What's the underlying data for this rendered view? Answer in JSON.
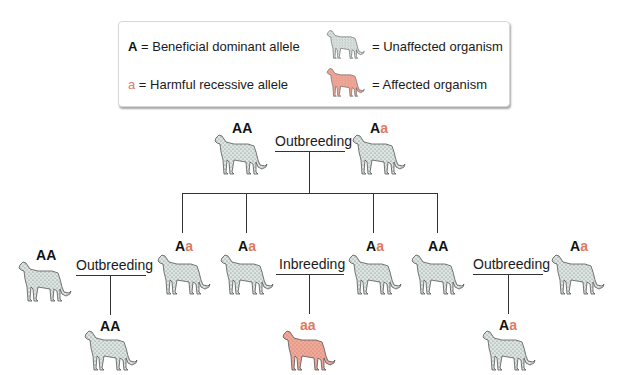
{
  "legend": {
    "dominant_symbol": "A",
    "dominant_text": " = Beneficial dominant allele",
    "recessive_symbol": "a",
    "recessive_text": " = Harmful recessive allele",
    "unaffected_text": "= Unaffected organism",
    "affected_text": "= Affected organism"
  },
  "colors": {
    "recessive": "#e07a5f",
    "unaffected_fill": "#dde5e3",
    "affected_fill": "#f0a898",
    "line": "#333333"
  },
  "top": {
    "parent1": {
      "g1": "A",
      "g2": "A"
    },
    "parent2": {
      "g1": "A",
      "g2": "a"
    },
    "cross_label": "Outbreeding"
  },
  "offspring": [
    {
      "g1": "A",
      "g2": "a"
    },
    {
      "g1": "A",
      "g2": "a"
    },
    {
      "g1": "A",
      "g2": "a"
    },
    {
      "g1": "A",
      "g2": "A"
    }
  ],
  "row2": {
    "left_mate": {
      "g1": "A",
      "g2": "A"
    },
    "left_label": "Outbreeding",
    "middle_label": "Inbreeding",
    "right_label": "Outbreeding",
    "right_mate": {
      "g1": "A",
      "g2": "a"
    }
  },
  "results": [
    {
      "g1": "A",
      "g2": "A",
      "status": "unaffected"
    },
    {
      "g1": "a",
      "g2": "a",
      "status": "affected"
    },
    {
      "g1": "A",
      "g2": "a",
      "status": "unaffected"
    }
  ]
}
